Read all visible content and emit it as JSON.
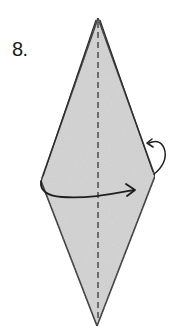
{
  "step": {
    "number_label": "8."
  },
  "diagram": {
    "shape": "diamond / kite base",
    "paper_color": "#d4d4d4",
    "line_color": "#2a2a2a",
    "elements": [
      "valley fold line (dashed, vertical center)",
      "curved arrow on right edge (fold behind / tuck)",
      "curved arrow across middle pointing right (fold left flap over to right)"
    ]
  }
}
